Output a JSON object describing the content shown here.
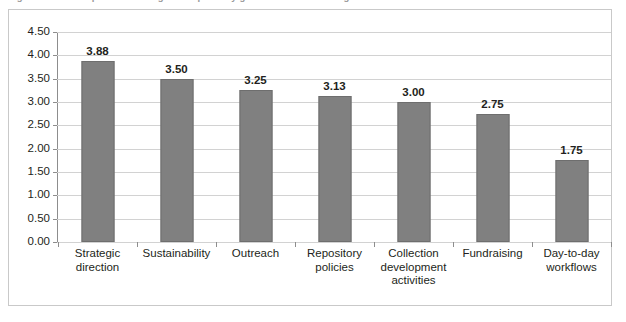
{
  "caption": {
    "text": "Figure 4. Mean importance ratings for repository governance and management activities",
    "visible_note": "clipped at top edge"
  },
  "chart_data": {
    "type": "bar",
    "title": "",
    "xlabel": "",
    "ylabel": "",
    "categories": [
      "Strategic direction",
      "Sustainability",
      "Outreach",
      "Repository policies",
      "Collection development activities",
      "Fundraising",
      "Day-to-day workflows"
    ],
    "category_lines": [
      [
        "Strategic direction"
      ],
      [
        "Sustainability"
      ],
      [
        "Outreach"
      ],
      [
        "Repository",
        "policies"
      ],
      [
        "Collection",
        "development",
        "activities"
      ],
      [
        "Fundraising"
      ],
      [
        "Day-to-day",
        "workflows"
      ]
    ],
    "values": [
      3.88,
      3.5,
      3.25,
      3.13,
      3.0,
      2.75,
      1.75
    ],
    "value_labels": [
      "3.88",
      "3.50",
      "3.25",
      "3.13",
      "3.00",
      "2.75",
      "1.75"
    ],
    "ylim": [
      0.0,
      4.5
    ],
    "ytick_values": [
      4.5,
      4.0,
      3.5,
      3.0,
      2.5,
      2.0,
      1.5,
      1.0,
      0.5,
      0.0
    ],
    "ytick_labels": [
      "4.50",
      "4.00",
      "3.50",
      "3.00",
      "2.50",
      "2.00",
      "1.50",
      "1.00",
      "0.50",
      "0.00"
    ],
    "grid": true,
    "legend": false,
    "bar_color": "#808080",
    "bar_border_color": "#6e6e6e",
    "gridline_color": "#d2d2d2",
    "axis_color": "#8d8d8d",
    "text_color": "#231f20"
  }
}
